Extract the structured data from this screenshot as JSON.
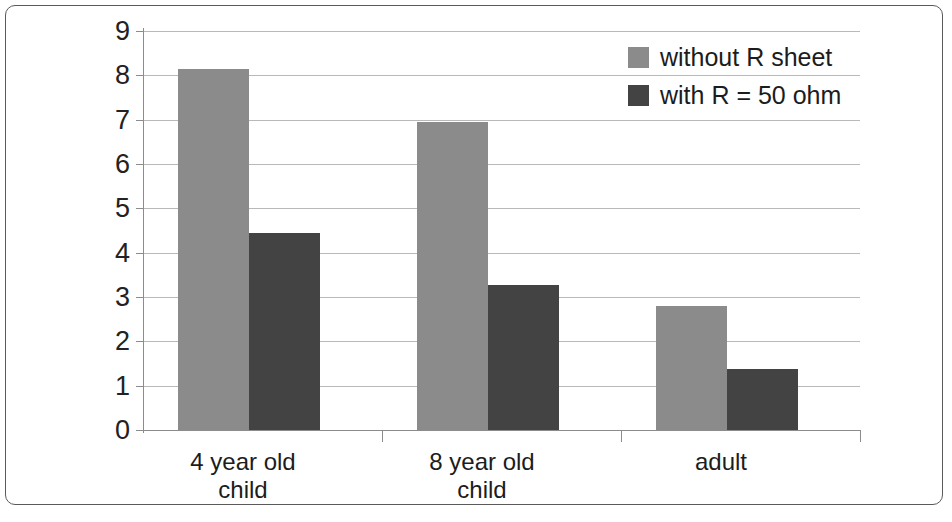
{
  "chart_data": {
    "type": "bar",
    "title": "",
    "subtitle": "",
    "xlabel": "",
    "ylabel": "",
    "categories": [
      "4 year old child",
      "8 year old child",
      "adult"
    ],
    "category_lines": [
      [
        "4 year old",
        "child"
      ],
      [
        "8 year old",
        "child"
      ],
      [
        "adult"
      ]
    ],
    "series": [
      {
        "name": "without R sheet",
        "color": "#8b8b8b",
        "values": [
          8.15,
          6.95,
          2.8
        ]
      },
      {
        "name": "with R = 50 ohm",
        "color": "#434343",
        "values": [
          4.45,
          3.27,
          1.38
        ]
      }
    ],
    "ylim": [
      0,
      9
    ],
    "ytick_labels": [
      "9",
      "8",
      "7",
      "6",
      "5",
      "4",
      "3",
      "2",
      "1",
      "0"
    ],
    "ytick_values": [
      9,
      8,
      7,
      6,
      5,
      4,
      3,
      2,
      1,
      0
    ],
    "grid": true,
    "grid_axis": "y",
    "legend_position": "top-right",
    "axis_color": "#8c8c8c",
    "grid_color": "#b9b9b9",
    "background": "#ffffff",
    "frame": true
  },
  "legend": {
    "entries": [
      {
        "label": "without R sheet",
        "swatch": "light"
      },
      {
        "label": "with R = 50 ohm",
        "swatch": "dark"
      }
    ]
  },
  "axis": {
    "y_labels": [
      "9",
      "8",
      "7",
      "6",
      "5",
      "4",
      "3",
      "2",
      "1",
      "0"
    ],
    "x_labels": [
      "4 year old child",
      "8 year old child",
      "adult"
    ]
  }
}
